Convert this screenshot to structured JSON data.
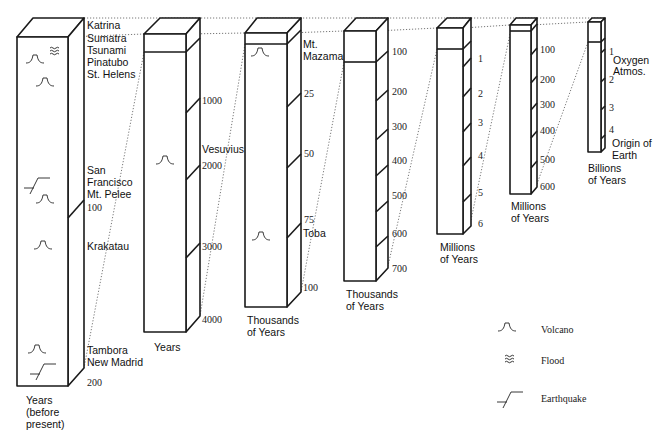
{
  "columns": [
    {
      "id": "c1",
      "scale_label": [
        "Years",
        "(before",
        "present)"
      ],
      "ticks": [
        "100",
        "200"
      ],
      "events": [
        {
          "label": "Katrina",
          "type": "flood"
        },
        {
          "label": "Sumatra",
          "type": "flood"
        },
        {
          "label": "Tsunami",
          "type": "flood"
        },
        {
          "label": "Pinatubo",
          "type": "volcano"
        },
        {
          "label": "St. Helens",
          "type": "volcano"
        },
        {
          "label": "San",
          "type": "earthquake"
        },
        {
          "label": "Francisco",
          "type": "earthquake"
        },
        {
          "label": "Mt. Pelee",
          "type": "volcano"
        },
        {
          "label": "Krakatau",
          "type": "volcano"
        },
        {
          "label": "Tambora",
          "type": "volcano"
        },
        {
          "label": "New Madrid",
          "type": "earthquake"
        }
      ]
    },
    {
      "id": "c2",
      "scale_label": [
        "Years"
      ],
      "ticks": [
        "1000",
        "2000",
        "3000",
        "4000"
      ],
      "events": [
        {
          "label": "Vesuvius",
          "type": "volcano"
        }
      ]
    },
    {
      "id": "c3",
      "scale_label": [
        "Thousands",
        "of Years"
      ],
      "ticks": [
        "25",
        "50",
        "75",
        "100"
      ],
      "events": [
        {
          "label": "Mt.",
          "type": "volcano"
        },
        {
          "label": "Mazama",
          "type": "volcano"
        },
        {
          "label": "Toba",
          "type": "volcano"
        }
      ]
    },
    {
      "id": "c4",
      "scale_label": [
        "Thousands",
        "of Years"
      ],
      "ticks": [
        "100",
        "200",
        "300",
        "400",
        "500",
        "600",
        "700"
      ],
      "events": []
    },
    {
      "id": "c5",
      "scale_label": [
        "Millions",
        "of Years"
      ],
      "ticks": [
        "1",
        "2",
        "3",
        "4",
        "5",
        "6"
      ],
      "events": []
    },
    {
      "id": "c6",
      "scale_label": [
        "Millions",
        "of Years"
      ],
      "ticks": [
        "100",
        "200",
        "300",
        "400",
        "500",
        "600"
      ],
      "events": []
    },
    {
      "id": "c7",
      "scale_label": [
        "Billions",
        "of Years"
      ],
      "ticks": [
        "1",
        "2",
        "3",
        "4"
      ],
      "events": [
        {
          "label": "Oxygen",
          "type": "text"
        },
        {
          "label": "Atmos.",
          "type": "text"
        },
        {
          "label": "Origin of",
          "type": "text"
        },
        {
          "label": "Earth",
          "type": "text"
        }
      ]
    }
  ],
  "legend": {
    "items": [
      {
        "icon": "volcano-icon",
        "label": "Volcano"
      },
      {
        "icon": "flood-icon",
        "label": "Flood"
      },
      {
        "icon": "earthquake-icon",
        "label": "Earthquake"
      }
    ]
  }
}
